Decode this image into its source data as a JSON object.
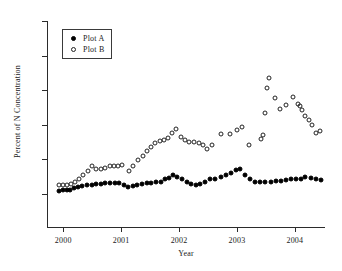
{
  "chart_data": {
    "type": "scatter",
    "title": "",
    "xlabel": "Year",
    "ylabel": "Percent of N Concentration",
    "xlim": [
      1999.72,
      2004.52
    ],
    "ylim": [
      0,
      50
    ],
    "yticks": [
      0,
      10,
      20,
      30,
      40,
      50
    ],
    "ytick_labels": [
      "0",
      "10",
      "20",
      "30",
      "40",
      "50"
    ],
    "xticks": [
      2000,
      2001,
      2002,
      2003,
      2004
    ],
    "xtick_labels": [
      "2000",
      "2001",
      "2002",
      "2003",
      "2004"
    ],
    "grid": false,
    "legend_position": "upper-left-inset",
    "series": [
      {
        "name": "Plot A",
        "marker": "filled-circle",
        "color": "#000000",
        "points": [
          [
            1999.92,
            1.0
          ],
          [
            2000.0,
            1.2
          ],
          [
            2000.06,
            1.3
          ],
          [
            2000.12,
            1.2
          ],
          [
            2000.19,
            1.7
          ],
          [
            2000.26,
            2.1
          ],
          [
            2000.33,
            2.3
          ],
          [
            2000.41,
            2.5
          ],
          [
            2000.49,
            2.7
          ],
          [
            2000.57,
            2.9
          ],
          [
            2000.65,
            3.0
          ],
          [
            2000.73,
            3.1
          ],
          [
            2000.81,
            3.3
          ],
          [
            2000.89,
            3.3
          ],
          [
            2000.97,
            3.2
          ],
          [
            2001.05,
            2.6
          ],
          [
            2001.12,
            2.0
          ],
          [
            2001.2,
            2.2
          ],
          [
            2001.28,
            2.5
          ],
          [
            2001.36,
            3.0
          ],
          [
            2001.44,
            3.2
          ],
          [
            2001.52,
            3.3
          ],
          [
            2001.6,
            3.4
          ],
          [
            2001.68,
            3.6
          ],
          [
            2001.75,
            4.3
          ],
          [
            2001.82,
            4.7
          ],
          [
            2001.89,
            5.5
          ],
          [
            2001.97,
            4.9
          ],
          [
            2002.05,
            4.2
          ],
          [
            2002.13,
            3.6
          ],
          [
            2002.21,
            3.0
          ],
          [
            2002.29,
            2.6
          ],
          [
            2002.37,
            2.9
          ],
          [
            2002.45,
            3.6
          ],
          [
            2002.53,
            4.2
          ],
          [
            2002.62,
            4.2
          ],
          [
            2002.72,
            4.9
          ],
          [
            2002.81,
            5.6
          ],
          [
            2002.9,
            6.2
          ],
          [
            2002.98,
            7.0
          ],
          [
            2003.06,
            7.1
          ],
          [
            2003.14,
            5.4
          ],
          [
            2003.22,
            4.3
          ],
          [
            2003.31,
            3.6
          ],
          [
            2003.4,
            3.5
          ],
          [
            2003.49,
            3.5
          ],
          [
            2003.58,
            3.6
          ],
          [
            2003.67,
            3.7
          ],
          [
            2003.76,
            3.8
          ],
          [
            2003.85,
            4.1
          ],
          [
            2003.94,
            4.2
          ],
          [
            2004.02,
            4.2
          ],
          [
            2004.1,
            4.3
          ],
          [
            2004.18,
            5.0
          ],
          [
            2004.27,
            4.6
          ],
          [
            2004.36,
            4.3
          ],
          [
            2004.45,
            4.0
          ]
        ]
      },
      {
        "name": "Plot B",
        "marker": "open-circle",
        "color": "#222222",
        "points": [
          [
            1999.92,
            2.5
          ],
          [
            2000.0,
            2.6
          ],
          [
            2000.07,
            2.6
          ],
          [
            2000.14,
            3.0
          ],
          [
            2000.21,
            3.5
          ],
          [
            2000.28,
            4.4
          ],
          [
            2000.35,
            5.5
          ],
          [
            2000.42,
            6.6
          ],
          [
            2000.49,
            8.0
          ],
          [
            2000.57,
            7.3
          ],
          [
            2000.65,
            7.2
          ],
          [
            2000.73,
            7.6
          ],
          [
            2000.8,
            8.1
          ],
          [
            2000.87,
            8.2
          ],
          [
            2000.94,
            8.2
          ],
          [
            2001.01,
            8.5
          ],
          [
            2001.13,
            6.6
          ],
          [
            2001.21,
            8.2
          ],
          [
            2001.29,
            9.7
          ],
          [
            2001.37,
            11.0
          ],
          [
            2001.44,
            12.3
          ],
          [
            2001.52,
            13.5
          ],
          [
            2001.59,
            14.8
          ],
          [
            2001.67,
            15.4
          ],
          [
            2001.74,
            15.6
          ],
          [
            2001.81,
            16.3
          ],
          [
            2001.88,
            17.5
          ],
          [
            2001.95,
            18.8
          ],
          [
            2002.03,
            16.5
          ],
          [
            2002.1,
            15.6
          ],
          [
            2002.18,
            15.0
          ],
          [
            2002.26,
            14.9
          ],
          [
            2002.34,
            14.7
          ],
          [
            2002.42,
            14.3
          ],
          [
            2002.49,
            13.1
          ],
          [
            2002.57,
            14.2
          ],
          [
            2002.72,
            17.4
          ],
          [
            2002.88,
            17.3
          ],
          [
            2003.0,
            18.5
          ],
          [
            2003.09,
            19.5
          ],
          [
            2003.21,
            14.1
          ],
          [
            2003.42,
            16.0
          ],
          [
            2003.45,
            17.0
          ],
          [
            2003.49,
            23.3
          ],
          [
            2003.52,
            30.5
          ],
          [
            2003.55,
            33.5
          ],
          [
            2003.66,
            27.8
          ],
          [
            2003.74,
            24.5
          ],
          [
            2003.85,
            25.6
          ],
          [
            2003.97,
            27.9
          ],
          [
            2004.05,
            25.9
          ],
          [
            2004.09,
            25.3
          ],
          [
            2004.13,
            24.3
          ],
          [
            2004.18,
            22.6
          ],
          [
            2004.24,
            21.3
          ],
          [
            2004.3,
            19.9
          ],
          [
            2004.36,
            17.6
          ],
          [
            2004.44,
            18.1
          ]
        ]
      }
    ]
  },
  "legend": {
    "entries": [
      {
        "label": "Plot A",
        "marker": "filled-circle"
      },
      {
        "label": "Plot B",
        "marker": "open-circle"
      }
    ]
  }
}
